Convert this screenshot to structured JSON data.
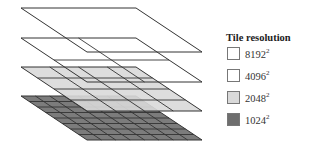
{
  "diagram": {
    "layers": [
      {
        "resolution": "8192",
        "grid": 1,
        "fill": "#ffffff",
        "y": 8
      },
      {
        "resolution": "4096",
        "grid": 2,
        "fill": "#ffffff",
        "y": 38
      },
      {
        "resolution": "2048",
        "grid": 4,
        "fill": "#d9d9d9",
        "y": 67
      },
      {
        "resolution": "1024",
        "grid": 8,
        "fill": "#6e6e6e",
        "y": 96
      }
    ],
    "stroke": "#333333"
  },
  "legend": {
    "title": "Tile resolution",
    "items": [
      {
        "label": "8192",
        "exponent": "2",
        "color": "#ffffff"
      },
      {
        "label": "4096",
        "exponent": "2",
        "color": "#ffffff"
      },
      {
        "label": "2048",
        "exponent": "2",
        "color": "#d9d9d9"
      },
      {
        "label": "1024",
        "exponent": "2",
        "color": "#6e6e6e"
      }
    ]
  }
}
